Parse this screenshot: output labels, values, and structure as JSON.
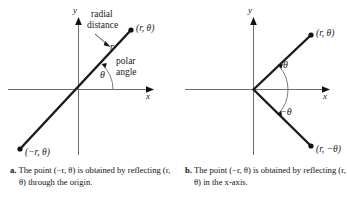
{
  "figure": {
    "type": "math-diagram",
    "topic": "Polar coordinates: reflections of the point (r, theta)",
    "background": "#ffffff",
    "ink_color": "#1a1a1a",
    "axis_color": "#6e6e6e"
  },
  "panel_a": {
    "id": "a",
    "axes": {
      "x_label": "x",
      "y_label": "y"
    },
    "annotations": {
      "radial_line1": "radial",
      "radial_line2": "distance",
      "radial_symbol": "r",
      "angle_line1": "polar",
      "angle_line2": "angle",
      "angle_symbol": "θ"
    },
    "points": [
      {
        "name": "point-r-theta",
        "label": "(r, θ)",
        "x": 131,
        "y": 30
      },
      {
        "name": "point-neg-r-theta",
        "label": "(−r, θ)",
        "x": 20,
        "y": 149
      }
    ],
    "caption_marker": "a.",
    "caption_line1": "The point (−r, θ) is obtained by",
    "caption_line2": "reflecting (r, θ) through the origin."
  },
  "panel_b": {
    "id": "b",
    "axes": {
      "x_label": "x",
      "y_label": "y"
    },
    "annotations": {
      "angle_symbol": "θ",
      "neg_angle_symbol": "−θ"
    },
    "points": [
      {
        "name": "point-r-theta",
        "label": "(r, θ)",
        "x": 310,
        "y": 35
      },
      {
        "name": "point-r-neg-theta",
        "label": "(r, −θ)",
        "x": 310,
        "y": 146
      }
    ],
    "caption_marker": "b.",
    "caption_line1": "The point (−r, θ) is obtained by",
    "caption_line2": "reflecting (r, θ) in the x-axis."
  }
}
